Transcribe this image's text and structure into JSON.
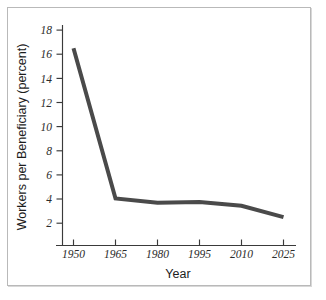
{
  "figure": {
    "background_color": "#ffffff",
    "frame_color": "#b9b9b9"
  },
  "chart_data": {
    "type": "line",
    "title": "",
    "xlabel": "Year",
    "ylabel": "Workers per Beneficiary (percent)",
    "categories": [
      "1950",
      "1965",
      "1980",
      "1995",
      "2010",
      "2025"
    ],
    "x": [
      1950,
      1965,
      1980,
      1995,
      2010,
      2025
    ],
    "values": [
      16.5,
      4.05,
      3.7,
      3.75,
      3.45,
      2.5
    ],
    "series": [
      {
        "name": "Workers per Beneficiary",
        "values": [
          16.5,
          4.05,
          3.7,
          3.75,
          3.45,
          2.5
        ],
        "color": "#4a4a4a",
        "line_width": 4
      }
    ],
    "xlim": [
      1950,
      2025
    ],
    "ylim": [
      0,
      19
    ],
    "yticks": [
      2,
      4,
      6,
      8,
      10,
      12,
      14,
      16,
      18
    ],
    "ytick_labels": [
      "2",
      "4",
      "6",
      "8",
      "10",
      "12",
      "14",
      "16",
      "18"
    ],
    "xtick_labels": [
      "1950",
      "1965",
      "1980",
      "1995",
      "2010",
      "2025"
    ],
    "grid": false,
    "legend": false,
    "legend_position": "none",
    "annotations": []
  },
  "axes": {
    "y_title": "Workers per Beneficiary (percent)",
    "x_title": "Year",
    "y_tick_labels": [
      "18",
      "16",
      "14",
      "12",
      "10",
      "8",
      "6",
      "4",
      "2"
    ],
    "x_tick_labels": [
      "1950",
      "1965",
      "1980",
      "1995",
      "2010",
      "2025"
    ]
  }
}
